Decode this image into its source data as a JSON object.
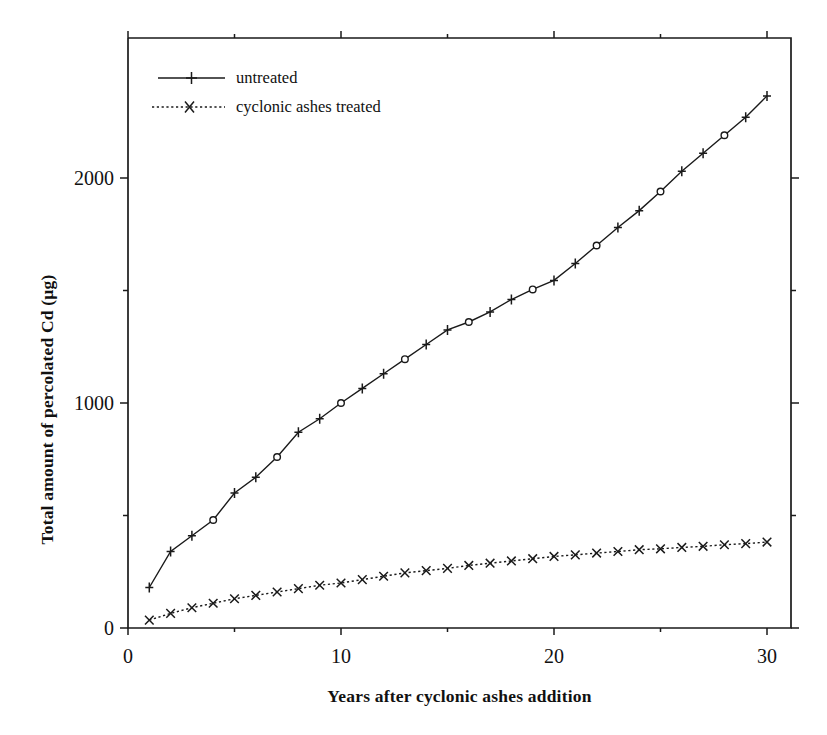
{
  "chart_data": {
    "type": "line",
    "title": "",
    "xlabel": "Years after cyclonic ashes addition",
    "ylabel": "Total amount of percolated Cd (µg)",
    "xlim": [
      0,
      31
    ],
    "ylim": [
      0,
      2500
    ],
    "grid": false,
    "legend_position": "top-left",
    "x_ticks_major": [
      0,
      10,
      20,
      30
    ],
    "x_tick_labels": [
      "0",
      "10",
      "20",
      "30"
    ],
    "x_ticks_minor": [
      5,
      15,
      25
    ],
    "y_ticks_major": [
      0,
      1000,
      2000
    ],
    "y_tick_labels": [
      "0",
      "1000",
      "2000"
    ],
    "y_ticks_minor": [
      500,
      1500
    ],
    "x": [
      1,
      2,
      3,
      4,
      5,
      6,
      7,
      8,
      9,
      10,
      11,
      12,
      13,
      14,
      15,
      16,
      17,
      18,
      19,
      20,
      21,
      22,
      23,
      24,
      25,
      26,
      27,
      28,
      29,
      30
    ],
    "series": [
      {
        "name": "untreated",
        "marker": "plus",
        "line_style": "solid",
        "color": "#1a1a1a",
        "values": [
          180,
          340,
          410,
          480,
          600,
          670,
          760,
          870,
          930,
          1000,
          1065,
          1130,
          1195,
          1260,
          1325,
          1360,
          1405,
          1460,
          1505,
          1545,
          1620,
          1700,
          1780,
          1855,
          1940,
          2030,
          2110,
          2190,
          2270,
          2365
        ]
      },
      {
        "name": "cyclonic ashes treated",
        "marker": "cross",
        "line_style": "dotted",
        "color": "#1a1a1a",
        "values": [
          35,
          65,
          90,
          110,
          130,
          145,
          160,
          175,
          190,
          200,
          215,
          230,
          245,
          255,
          265,
          278,
          288,
          298,
          308,
          318,
          325,
          333,
          340,
          348,
          352,
          358,
          363,
          370,
          375,
          382
        ]
      }
    ]
  },
  "legend": {
    "items": [
      {
        "label": "untreated"
      },
      {
        "label": "cyclonic ashes treated"
      }
    ]
  },
  "axes": {
    "x_title": "Years after cyclonic ashes addition",
    "y_title": "Total amount of percolated Cd (µg)"
  }
}
